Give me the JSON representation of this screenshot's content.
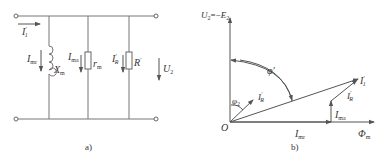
{
  "circuit": {
    "caption": "a)",
    "input_current": {
      "sym": "I",
      "sup": "′",
      "sub": "1"
    },
    "branches": [
      {
        "current": {
          "sym": "I",
          "sub": "mr"
        },
        "element": {
          "sym": "X",
          "sub": "m"
        },
        "type": "inductor"
      },
      {
        "current": {
          "sym": "I",
          "sub": "ma"
        },
        "element": {
          "sym": "r",
          "sub": "m"
        },
        "type": "resistor"
      },
      {
        "current": {
          "sym": "I",
          "sup": "′",
          "sub": "R"
        },
        "element": {
          "sym": "R",
          "sup": "′"
        },
        "type": "resistor"
      }
    ],
    "voltage": {
      "sym": "U",
      "sub": "2"
    }
  },
  "phasor": {
    "caption": "b)",
    "vertical_axis_label": {
      "lhs": "U",
      "lhs_sub": "2",
      "eq": "=−",
      "rhs": "E",
      "rhs_sub": "2"
    },
    "horizontal_axis_label": {
      "sym": "Φ",
      "sub": "m"
    },
    "origin": "O",
    "angle_large": "φ′",
    "angle_small": {
      "sym": "φ",
      "sub": "2"
    },
    "vectors": {
      "I1": {
        "sym": "I",
        "sup": "′",
        "sub": "1"
      },
      "IR_origin": {
        "sym": "I",
        "sup": "′",
        "sub": "R"
      },
      "IR_tip": {
        "sym": "I",
        "sup": "′",
        "sub": "R"
      },
      "Ima": {
        "sym": "I",
        "sub": "ma"
      },
      "Imr": {
        "sym": "I",
        "sub": "mr"
      }
    }
  }
}
